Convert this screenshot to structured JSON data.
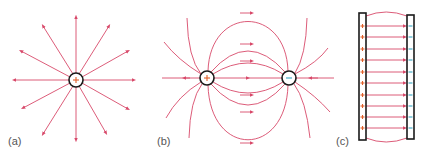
{
  "panels": [
    {
      "id": "a",
      "label": "(a)",
      "description": "Isolated positive point charge with radial field lines pointing outward",
      "charges": [
        {
          "sign": "+",
          "x": 76,
          "y": 80
        }
      ],
      "line_count": 16
    },
    {
      "id": "b",
      "label": "(b)",
      "description": "Electric dipole: field lines leave the positive charge and enter the negative charge",
      "charges": [
        {
          "sign": "+",
          "x": 207,
          "y": 78
        },
        {
          "sign": "-",
          "x": 289,
          "y": 78
        }
      ]
    },
    {
      "id": "c",
      "label": "(c)",
      "description": "Parallel plates: uniform field from positive plate to negative plate",
      "plates": [
        {
          "sign": "+",
          "x": 362
        },
        {
          "sign": "-",
          "x": 410
        }
      ],
      "line_count": 11
    }
  ],
  "colors": {
    "field_line": "#d8496a",
    "outline": "#1a1a1a",
    "positive_sign": "#e0602a",
    "negative_sign": "#3aa6c4",
    "label_text": "#555555"
  }
}
